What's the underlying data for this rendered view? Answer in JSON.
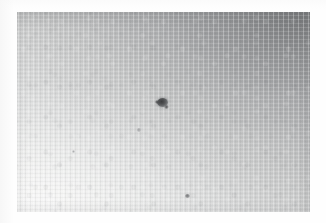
{
  "document": {
    "kind": "scanned-photograph",
    "page_background": "#ffffff",
    "width": 326,
    "height": 223,
    "caption": "",
    "visible_text": ""
  },
  "photo": {
    "name": "grayscale-photograph",
    "subject": "textured gray surface with dark specks",
    "frame": {
      "x": 17,
      "y": 12,
      "width": 293,
      "height": 200
    },
    "tone": {
      "darkest": "#8f9092",
      "midtone": "#c6c7c7",
      "lightest": "#eeeeed",
      "gradient_direction": "top-right dark to bottom-left light",
      "gradient_angle_deg": 212
    },
    "texture": {
      "type": "film-grain",
      "striation": "vertical",
      "secondary_striation": "horizontal"
    },
    "features": [
      {
        "label": "primary-dark-blob",
        "x": 157,
        "y": 98,
        "width": 11,
        "height": 9,
        "color": "#3c3d3e",
        "description": "large irregular dark spot, dominant feature"
      },
      {
        "label": "faint-small-dot",
        "x": 137,
        "y": 128,
        "width": 4,
        "height": 4,
        "color": "#9a9b9d",
        "description": "faint pale-gray speck below and left of the main blob"
      },
      {
        "label": "lower-small-dot",
        "x": 185,
        "y": 194,
        "width": 5,
        "height": 4,
        "color": "#6e7072",
        "description": "small dark dot near the lower edge"
      },
      {
        "label": "tiny-speck-upper-right",
        "x": 246,
        "y": 38,
        "width": 3,
        "height": 3,
        "color": "#969799",
        "description": "very faint speck in the dark upper-right field"
      },
      {
        "label": "tiny-speck-mid-left",
        "x": 72,
        "y": 150,
        "width": 3,
        "height": 3,
        "color": "#b4b5b6",
        "description": "very faint speck in the light lower-left field"
      }
    ]
  }
}
